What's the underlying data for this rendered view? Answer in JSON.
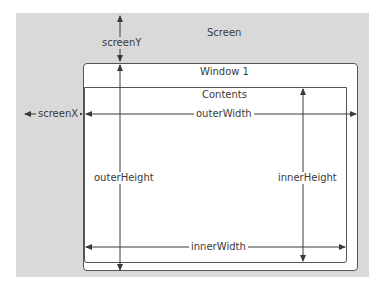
{
  "diagram": {
    "screen": {
      "label": "Screen",
      "fill": "#d9d9d9"
    },
    "window": {
      "label": "Window 1"
    },
    "contents": {
      "label": "Contents"
    },
    "measures": {
      "screenY": "screenY",
      "screenX": "screenX",
      "outerWidth": "outerWidth",
      "outerHeight": "outerHeight",
      "innerHeight": "innerHeight",
      "innerWidth": "innerWidth"
    },
    "line_color": "#3a3a3a"
  }
}
